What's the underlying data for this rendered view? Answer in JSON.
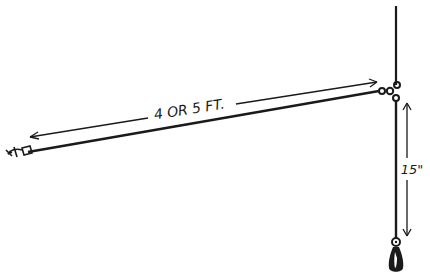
{
  "diagram": {
    "type": "fishing-rig-illustration",
    "labels": {
      "horizontal_length": "4 OR 5 FT.",
      "vertical_length": "15\""
    },
    "parts": [
      "hook",
      "horizontal-line",
      "three-way-swivel",
      "main-line",
      "dropper-line",
      "sinker"
    ],
    "colors": {
      "ink": "#1a1a1a",
      "background": "#ffffff"
    }
  }
}
